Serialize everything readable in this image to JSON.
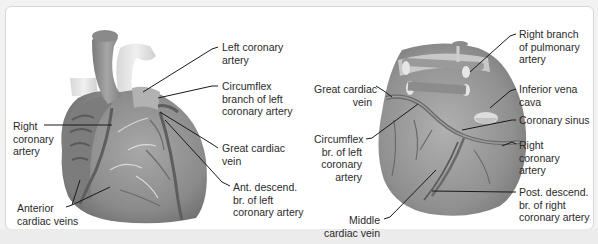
{
  "figure": {
    "views": [
      {
        "name": "anterior-view",
        "labels": [
          {
            "id": "left-coronary-artery",
            "text": "Left coronary\nartery"
          },
          {
            "id": "circumflex-branch",
            "text": "Circumflex\nbranch of left\ncoronary artery"
          },
          {
            "id": "right-coronary-artery",
            "text": "Right\ncoronary\nartery"
          },
          {
            "id": "great-cardiac-vein",
            "text": "Great cardiac\nvein"
          },
          {
            "id": "ant-descend-branch",
            "text": "Ant. descend.\nbr. of left\ncoronary artery"
          },
          {
            "id": "anterior-cardiac-veins",
            "text": "Anterior\ncardiac veins"
          }
        ]
      },
      {
        "name": "posterior-view",
        "labels": [
          {
            "id": "right-branch-pulmonary-artery",
            "text": "Right branch\nof pulmonary\nartery"
          },
          {
            "id": "great-cardiac-vein",
            "text": "Great cardiac\nvein"
          },
          {
            "id": "inferior-vena-cava",
            "text": "Inferior vena\ncava"
          },
          {
            "id": "coronary-sinus",
            "text": "Coronary sinus"
          },
          {
            "id": "circumflex-br",
            "text": "Circumflex\nbr. of left\ncoronary\nartery"
          },
          {
            "id": "right-coronary-artery",
            "text": "Right\ncoronary\nartery"
          },
          {
            "id": "post-descend-branch",
            "text": "Post. descend.\nbr. of right\ncoronary artery"
          },
          {
            "id": "middle-cardiac-vein",
            "text": "Middle\ncardiac vein"
          }
        ]
      }
    ],
    "colors": {
      "heart_fill": "#8c8c8c",
      "heart_light": "#bdbdbd",
      "vessel_light": "#dcdcdc",
      "vessel_dark": "#5e5e5e",
      "leader_line": "#1a1a1a",
      "panel_bg": "#ffffff",
      "page_bg": "#f2f2f2"
    }
  }
}
